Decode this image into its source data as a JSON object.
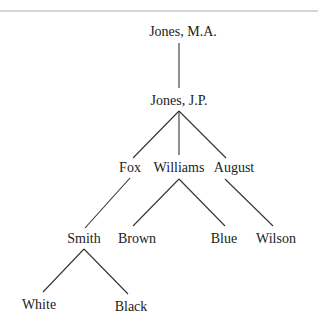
{
  "diagram": {
    "type": "tree",
    "nodes": [
      {
        "id": "jones_ma",
        "label": "Jones, M.A.",
        "x": 183,
        "y": 36
      },
      {
        "id": "jones_jp",
        "label": "Jones, J.P.",
        "x": 179,
        "y": 105
      },
      {
        "id": "fox",
        "label": "Fox",
        "x": 130,
        "y": 172
      },
      {
        "id": "williams",
        "label": "Williams",
        "x": 179,
        "y": 172
      },
      {
        "id": "august",
        "label": "August",
        "x": 234,
        "y": 172
      },
      {
        "id": "smith",
        "label": "Smith",
        "x": 84,
        "y": 243
      },
      {
        "id": "brown",
        "label": "Brown",
        "x": 137,
        "y": 243
      },
      {
        "id": "blue",
        "label": "Blue",
        "x": 224,
        "y": 243
      },
      {
        "id": "wilson",
        "label": "Wilson",
        "x": 276,
        "y": 243
      },
      {
        "id": "white",
        "label": "White",
        "x": 39,
        "y": 309
      },
      {
        "id": "black",
        "label": "Black",
        "x": 131,
        "y": 311
      }
    ],
    "edges": [
      {
        "from": "jones_ma",
        "to": "jones_jp",
        "x1": 179,
        "y1": 43,
        "x2": 179,
        "y2": 88
      },
      {
        "from": "jones_jp",
        "to": "fox",
        "x1": 179,
        "y1": 111,
        "x2": 133,
        "y2": 158
      },
      {
        "from": "jones_jp",
        "to": "williams",
        "x1": 179,
        "y1": 111,
        "x2": 179,
        "y2": 155
      },
      {
        "from": "jones_jp",
        "to": "august",
        "x1": 179,
        "y1": 111,
        "x2": 226,
        "y2": 158
      },
      {
        "from": "fox",
        "to": "smith",
        "x1": 130,
        "y1": 178,
        "x2": 85,
        "y2": 228
      },
      {
        "from": "williams",
        "to": "brown",
        "x1": 179,
        "y1": 179,
        "x2": 133,
        "y2": 226
      },
      {
        "from": "williams",
        "to": "blue",
        "x1": 179,
        "y1": 179,
        "x2": 225,
        "y2": 226
      },
      {
        "from": "august",
        "to": "wilson",
        "x1": 225,
        "y1": 179,
        "x2": 273,
        "y2": 226
      },
      {
        "from": "smith",
        "to": "white",
        "x1": 84,
        "y1": 249,
        "x2": 43,
        "y2": 292
      },
      {
        "from": "smith",
        "to": "black",
        "x1": 84,
        "y1": 249,
        "x2": 128,
        "y2": 294
      }
    ]
  }
}
